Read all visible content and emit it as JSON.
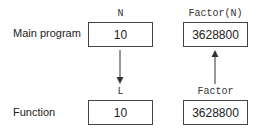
{
  "rows": {
    "main": {
      "label": "Main program"
    },
    "function": {
      "label": "Function"
    }
  },
  "variables": {
    "main_left": {
      "name": "N",
      "value": "10"
    },
    "main_right": {
      "name": "Factor(N)",
      "value": "3628800"
    },
    "func_left": {
      "name": "L",
      "value": "10"
    },
    "func_right": {
      "name": "Factor",
      "value": "3628800"
    }
  },
  "arrows": [
    {
      "from": "main_left",
      "to": "func_left",
      "direction": "down"
    },
    {
      "from": "func_right",
      "to": "main_right",
      "direction": "up"
    }
  ]
}
